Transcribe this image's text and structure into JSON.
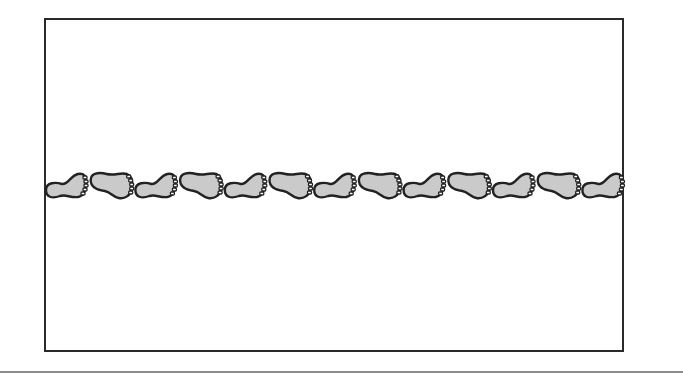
{
  "illustration": {
    "subject": "footprints-trail",
    "footprint_count": 13,
    "pattern": "alternating left and right footprints walking right",
    "colors": {
      "fill": "#cacaca",
      "outline": "#222222",
      "frame": "#2a2a2a",
      "rule": "#8a8a8a",
      "background": "#ffffff"
    }
  }
}
